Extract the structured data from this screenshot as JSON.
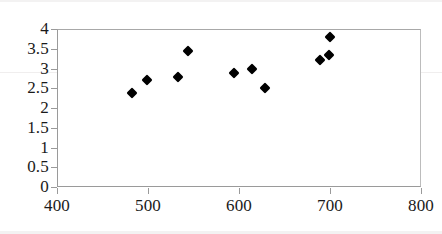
{
  "chart_data": {
    "type": "scatter",
    "title": "",
    "subtitle": "",
    "xlabel": "",
    "ylabel": "",
    "xlim": [
      400,
      800
    ],
    "ylim": [
      0,
      4
    ],
    "xticks": [
      400,
      500,
      600,
      700,
      800
    ],
    "yticks": [
      0,
      0.5,
      1,
      1.5,
      2,
      2.5,
      3,
      3.5,
      4
    ],
    "xtick_labels": [
      "400",
      "500",
      "600",
      "700",
      "800"
    ],
    "ytick_labels": [
      "0",
      "0.5",
      "1",
      "1.5",
      "2",
      "2.5",
      "3",
      "3.5",
      "4"
    ],
    "grid": false,
    "legend": false,
    "legend_position": "none",
    "marker": "diamond",
    "marker_color": "#000000",
    "series": [
      {
        "name": "series-1",
        "points": [
          {
            "x": 482,
            "y": 2.38
          },
          {
            "x": 499,
            "y": 2.71
          },
          {
            "x": 533,
            "y": 2.78
          },
          {
            "x": 544,
            "y": 3.44
          },
          {
            "x": 594,
            "y": 2.89
          },
          {
            "x": 614,
            "y": 2.99
          },
          {
            "x": 629,
            "y": 2.51
          },
          {
            "x": 689,
            "y": 3.22
          },
          {
            "x": 699,
            "y": 3.34
          },
          {
            "x": 700,
            "y": 3.8
          }
        ]
      }
    ]
  }
}
